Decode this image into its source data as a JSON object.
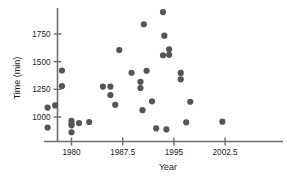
{
  "chart_data": {
    "type": "scatter",
    "title": "",
    "xlabel": "Year",
    "ylabel": "Time (min)",
    "xlim": [
      1975.8,
      2004.5
    ],
    "ylim": [
      830,
      1990
    ],
    "grid": false,
    "legend": null,
    "xticks": [
      1980,
      1987.5,
      1995,
      2002.5
    ],
    "xtick_labels": [
      "1980",
      "1987.5",
      "1995",
      "2002.5"
    ],
    "yticks": [
      1000,
      1250,
      1500,
      1750
    ],
    "ytick_labels": [
      "1000",
      "1250",
      "1500",
      "1750"
    ],
    "marker": {
      "shape": "circle",
      "color": "#555555",
      "size": 3.1
    },
    "points": [
      {
        "x": 1976.5,
        "y": 1085
      },
      {
        "x": 1976.5,
        "y": 905
      },
      {
        "x": 1977.6,
        "y": 1105
      },
      {
        "x": 1978.6,
        "y": 1420
      },
      {
        "x": 1978.6,
        "y": 1280
      },
      {
        "x": 1980.0,
        "y": 965
      },
      {
        "x": 1980.0,
        "y": 940
      },
      {
        "x": 1980.0,
        "y": 925
      },
      {
        "x": 1980.0,
        "y": 862
      },
      {
        "x": 1981.1,
        "y": 945
      },
      {
        "x": 1982.6,
        "y": 955
      },
      {
        "x": 1984.6,
        "y": 1275
      },
      {
        "x": 1985.7,
        "y": 1275
      },
      {
        "x": 1985.7,
        "y": 1198
      },
      {
        "x": 1986.4,
        "y": 1110
      },
      {
        "x": 1987.0,
        "y": 1605
      },
      {
        "x": 1988.8,
        "y": 1400
      },
      {
        "x": 1990.1,
        "y": 1318
      },
      {
        "x": 1990.1,
        "y": 1262
      },
      {
        "x": 1990.6,
        "y": 1838
      },
      {
        "x": 1991.0,
        "y": 1418
      },
      {
        "x": 1990.4,
        "y": 1062
      },
      {
        "x": 1991.8,
        "y": 1142
      },
      {
        "x": 1992.4,
        "y": 898
      },
      {
        "x": 1993.4,
        "y": 1948
      },
      {
        "x": 1993.6,
        "y": 1735
      },
      {
        "x": 1993.4,
        "y": 1558
      },
      {
        "x": 1994.3,
        "y": 1612
      },
      {
        "x": 1994.3,
        "y": 1562
      },
      {
        "x": 1993.9,
        "y": 888
      },
      {
        "x": 1996.0,
        "y": 1398
      },
      {
        "x": 1996.0,
        "y": 1340
      },
      {
        "x": 1997.4,
        "y": 1138
      },
      {
        "x": 1996.8,
        "y": 952
      },
      {
        "x": 2002.1,
        "y": 958
      }
    ]
  }
}
